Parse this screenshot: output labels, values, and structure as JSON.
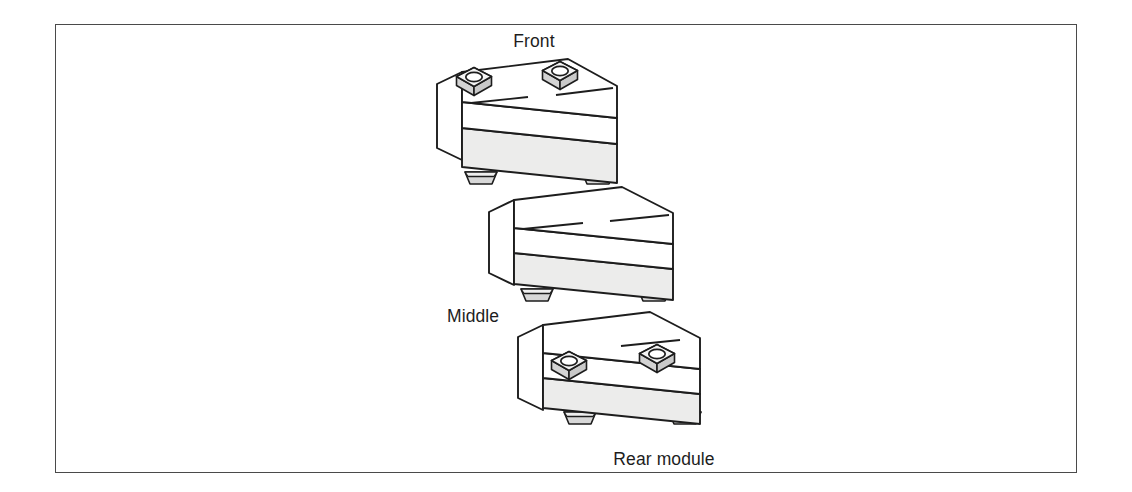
{
  "figure": {
    "kind": "isometric-exploded-assembly-diagram",
    "background_color": "#ffffff",
    "border_color": "#4a4a4a"
  },
  "palette": {
    "outline": "#1d1d1d",
    "top_face": "#ffffff",
    "left_face": "#ffffff",
    "front_face": "#ececeb",
    "nut_top": "#f4f4f4",
    "nut_side": "#d3d3d3",
    "nut_hole": "#ffffff",
    "foot_fill": "#d8d8d8",
    "foot_top": "#efefef"
  },
  "labels": {
    "front": "Front",
    "middle": "Middle",
    "rear": "Rear module"
  },
  "modules": [
    {
      "id": "front-module",
      "label": "Front",
      "label_position": "above",
      "nut_count": 2,
      "foot_count": 2,
      "groove_lines": 2
    },
    {
      "id": "middle-module",
      "label": "Middle",
      "label_position": "below-left",
      "nut_count": 0,
      "foot_count": 2,
      "groove_lines": 2
    },
    {
      "id": "rear-module",
      "label": "Rear module",
      "label_position": "below",
      "nut_count": 2,
      "foot_count": 2,
      "groove_lines": 1
    }
  ]
}
